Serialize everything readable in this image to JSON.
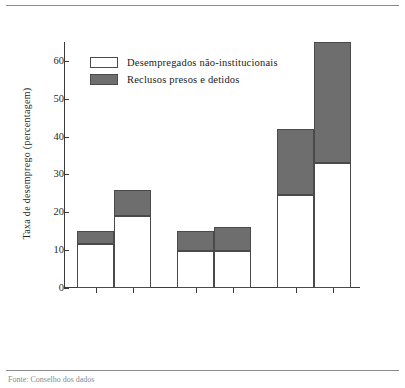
{
  "chart_data": {
    "type": "bar",
    "subtype": "stacked",
    "title": "",
    "xlabel": "",
    "ylabel": "Taxa de desemprego (percentagem)",
    "ylim": [
      0,
      65
    ],
    "yticks": [
      0,
      10,
      20,
      30,
      40,
      50,
      60
    ],
    "grid": false,
    "legend_position": "upper-left-inside",
    "categories": [
      "Não-universitários",
      "Desistências",
      "Não-universitários",
      "Desistências",
      "Não-universitários",
      "Desistências"
    ],
    "groups": [
      {
        "label": "Brancos",
        "members": [
          0,
          1
        ]
      },
      {
        "label": "Hispânicos",
        "members": [
          2,
          3
        ]
      },
      {
        "label": "Negros",
        "members": [
          4,
          5
        ]
      }
    ],
    "series": [
      {
        "name": "Desempregados não-institucionais",
        "color": "#ffffff",
        "values": [
          11.5,
          19.0,
          9.7,
          9.7,
          24.5,
          33.0
        ]
      },
      {
        "name": "Reclusos presos e detidos",
        "color": "#6e6e6e",
        "values": [
          3.5,
          7.0,
          5.3,
          6.3,
          17.5,
          32.0
        ]
      }
    ],
    "totals": [
      15,
      26,
      15,
      16,
      42,
      65
    ],
    "bar_labels": [
      "15 (24%)",
      "26 (26%)",
      "15 (37%)",
      "16 (38%)",
      "42 (42%)",
      "65 (49%)"
    ],
    "annotations": [
      {
        "bar": 0,
        "total": 15,
        "share_incarcerated": "24%"
      },
      {
        "bar": 1,
        "total": 26,
        "share_incarcerated": "26%"
      },
      {
        "bar": 2,
        "total": 15,
        "share_incarcerated": "37%"
      },
      {
        "bar": 3,
        "total": 16,
        "share_incarcerated": "38%"
      },
      {
        "bar": 4,
        "total": 42,
        "share_incarcerated": "42%"
      },
      {
        "bar": 5,
        "total": 65,
        "share_incarcerated": "49%"
      }
    ]
  },
  "legend": {
    "items": [
      {
        "label": "Desempregados não-institucionais",
        "swatch": "white"
      },
      {
        "label": "Reclusos presos e detidos",
        "swatch": "gray"
      }
    ]
  },
  "source": {
    "text": "Fonte: Conselho dos dados"
  }
}
